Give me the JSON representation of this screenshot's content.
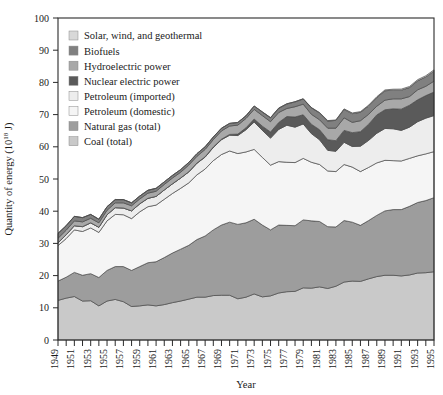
{
  "chart_data": {
    "type": "area",
    "stacked": true,
    "title": "",
    "xlabel": "Year",
    "ylabel": "Quantity of energy (10¹⁸ J)",
    "xlim": [
      1949,
      1995
    ],
    "ylim": [
      0,
      100
    ],
    "yticks": [
      0,
      10,
      20,
      30,
      40,
      50,
      60,
      70,
      80,
      90,
      100
    ],
    "ytick_labels": [
      "0",
      "10",
      "20",
      "30",
      "40",
      "50",
      "60",
      "70",
      "80",
      "90",
      "100"
    ],
    "x": [
      1949,
      1950,
      1951,
      1952,
      1953,
      1954,
      1955,
      1956,
      1957,
      1958,
      1959,
      1960,
      1961,
      1962,
      1963,
      1964,
      1965,
      1966,
      1967,
      1968,
      1969,
      1970,
      1971,
      1972,
      1973,
      1974,
      1975,
      1976,
      1977,
      1978,
      1979,
      1980,
      1981,
      1982,
      1983,
      1984,
      1985,
      1986,
      1987,
      1988,
      1989,
      1990,
      1991,
      1992,
      1993,
      1994,
      1995
    ],
    "xtick_labels": [
      "1949",
      "1951",
      "1953",
      "1955",
      "1957",
      "1959",
      "1961",
      "1963",
      "1965",
      "1967",
      "1969",
      "1971",
      "1973",
      "1975",
      "1977",
      "1979",
      "1981",
      "1983",
      "1985",
      "1987",
      "1989",
      "1991",
      "1993",
      "1995"
    ],
    "grid": false,
    "legend_position": "upper-left-inside",
    "series": [
      {
        "name": "Coal (total)",
        "color": "#c9c9c9",
        "order": 1,
        "values": [
          12.3,
          13.0,
          13.5,
          12.1,
          12.2,
          10.6,
          12.1,
          12.6,
          11.9,
          10.4,
          10.6,
          10.9,
          10.6,
          11.0,
          11.6,
          12.1,
          12.7,
          13.3,
          13.3,
          13.8,
          13.9,
          13.9,
          12.8,
          13.3,
          14.3,
          13.4,
          13.7,
          14.6,
          15.0,
          15.1,
          16.2,
          16.1,
          16.5,
          16.0,
          16.7,
          18.0,
          18.3,
          18.2,
          19.0,
          19.7,
          20.1,
          20.1,
          19.9,
          20.2,
          20.8,
          20.9,
          21.2
        ]
      },
      {
        "name": "Natural gas (total)",
        "color": "#9d9d9d",
        "order": 2,
        "values": [
          6.0,
          6.5,
          7.5,
          8.0,
          8.4,
          8.8,
          9.5,
          10.2,
          10.9,
          11.2,
          12.2,
          13.1,
          13.7,
          14.6,
          15.4,
          16.1,
          16.7,
          17.9,
          19.0,
          20.4,
          21.8,
          22.7,
          23.1,
          23.1,
          23.2,
          22.3,
          20.5,
          21.1,
          20.6,
          20.4,
          21.1,
          20.9,
          20.3,
          19.2,
          18.4,
          19.1,
          18.3,
          17.4,
          18.1,
          19.0,
          20.0,
          20.4,
          20.6,
          21.3,
          21.9,
          22.4,
          23.0
        ]
      },
      {
        "name": "Petroleum (domestic)",
        "color": "#f5f5f5",
        "order": 3,
        "values": [
          11.0,
          12.0,
          13.2,
          13.6,
          14.2,
          14.0,
          15.4,
          16.2,
          16.1,
          16.1,
          17.0,
          17.4,
          17.6,
          18.1,
          18.5,
          18.9,
          19.4,
          20.1,
          20.8,
          21.5,
          21.9,
          22.1,
          22.0,
          22.0,
          21.7,
          21.0,
          20.1,
          19.7,
          19.6,
          19.6,
          19.1,
          18.2,
          17.7,
          17.3,
          17.2,
          17.4,
          17.1,
          16.7,
          16.5,
          16.3,
          15.7,
          15.2,
          15.1,
          14.9,
          14.5,
          14.5,
          14.3
        ]
      },
      {
        "name": "Petroleum (imported)",
        "color": "#ededed",
        "order": 4,
        "values": [
          0.9,
          1.2,
          1.3,
          1.5,
          1.6,
          1.6,
          1.9,
          2.1,
          2.1,
          2.4,
          2.5,
          2.6,
          2.7,
          2.9,
          3.0,
          3.2,
          3.4,
          3.6,
          3.7,
          4.1,
          4.6,
          4.9,
          5.6,
          6.9,
          8.5,
          8.4,
          8.4,
          10.0,
          11.5,
          11.0,
          10.7,
          8.9,
          7.7,
          6.4,
          6.3,
          6.9,
          6.4,
          7.9,
          8.4,
          9.2,
          9.9,
          9.9,
          9.5,
          9.7,
          10.6,
          11.1,
          11.2
        ]
      },
      {
        "name": "Nuclear electric power",
        "color": "#5a5a5a",
        "order": 5,
        "values": [
          0.0,
          0.0,
          0.0,
          0.0,
          0.0,
          0.0,
          0.0,
          0.0,
          0.0,
          0.0,
          0.0,
          0.0,
          0.0,
          0.0,
          0.0,
          0.0,
          0.04,
          0.06,
          0.09,
          0.13,
          0.15,
          0.25,
          0.44,
          0.61,
          0.93,
          1.3,
          1.9,
          2.15,
          2.7,
          3.15,
          2.85,
          2.9,
          3.1,
          3.3,
          3.3,
          3.7,
          4.3,
          4.5,
          5.0,
          5.7,
          5.8,
          6.2,
          6.6,
          6.8,
          6.8,
          7.0,
          7.3
        ]
      },
      {
        "name": "Hydroelectric power",
        "color": "#a8a8a8",
        "order": 6,
        "values": [
          1.4,
          1.4,
          1.5,
          1.5,
          1.4,
          1.4,
          1.4,
          1.5,
          1.6,
          1.6,
          1.5,
          1.6,
          1.6,
          1.7,
          1.8,
          1.8,
          2.1,
          2.1,
          2.3,
          2.3,
          2.6,
          2.6,
          2.8,
          2.9,
          3.0,
          3.3,
          3.2,
          3.1,
          2.5,
          3.2,
          3.3,
          3.1,
          3.1,
          3.6,
          3.9,
          3.9,
          3.2,
          3.4,
          3.1,
          2.7,
          3.0,
          3.1,
          3.2,
          2.7,
          3.1,
          2.9,
          3.4
        ]
      },
      {
        "name": "Biofuels",
        "color": "#808080",
        "order": 7,
        "values": [
          1.5,
          1.4,
          1.4,
          1.3,
          1.2,
          1.1,
          1.1,
          1.0,
          1.0,
          0.9,
          0.9,
          0.9,
          0.9,
          0.8,
          0.8,
          0.8,
          0.8,
          0.8,
          0.8,
          0.8,
          0.8,
          0.8,
          0.8,
          0.8,
          1.0,
          1.1,
          1.2,
          1.3,
          1.4,
          1.5,
          1.6,
          2.0,
          2.1,
          2.2,
          2.4,
          2.6,
          2.7,
          2.6,
          2.6,
          2.7,
          2.9,
          2.7,
          2.7,
          2.8,
          2.8,
          2.9,
          3.1
        ]
      },
      {
        "name": "Solar, wind, and geothermal",
        "color": "#d8d8d8",
        "order": 8,
        "values": [
          0.0,
          0.0,
          0.0,
          0.0,
          0.0,
          0.0,
          0.0,
          0.0,
          0.0,
          0.0,
          0.0,
          0.01,
          0.01,
          0.01,
          0.01,
          0.02,
          0.02,
          0.03,
          0.03,
          0.04,
          0.04,
          0.05,
          0.05,
          0.06,
          0.06,
          0.07,
          0.08,
          0.09,
          0.09,
          0.07,
          0.08,
          0.11,
          0.13,
          0.14,
          0.15,
          0.18,
          0.21,
          0.23,
          0.24,
          0.25,
          0.27,
          0.29,
          0.32,
          0.33,
          0.35,
          0.37,
          0.39
        ]
      }
    ],
    "legend": [
      {
        "label": "Solar, wind, and geothermal",
        "color": "#d8d8d8"
      },
      {
        "label": "Biofuels",
        "color": "#808080"
      },
      {
        "label": "Hydroelectric power",
        "color": "#a8a8a8"
      },
      {
        "label": "Nuclear electric power",
        "color": "#5a5a5a"
      },
      {
        "label": "Petroleum (imported)",
        "color": "#ededed"
      },
      {
        "label": "Petroleum (domestic)",
        "color": "#f5f5f5"
      },
      {
        "label": "Natural gas (total)",
        "color": "#9d9d9d"
      },
      {
        "label": "Coal (total)",
        "color": "#c9c9c9"
      }
    ]
  }
}
